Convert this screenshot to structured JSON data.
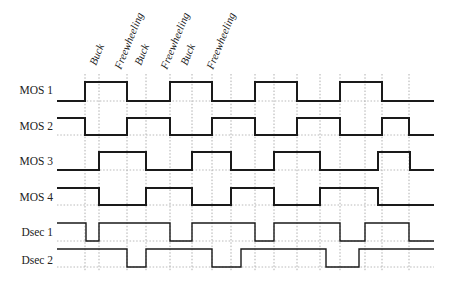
{
  "diagram": {
    "type": "timing-diagram",
    "x_start": 57,
    "x_end": 434,
    "grid_lines_x": [
      85,
      99,
      127,
      146,
      170,
      192,
      212,
      231,
      255,
      274,
      297,
      320,
      340,
      365,
      382,
      409
    ],
    "phase_labels": [
      {
        "text": "Buck",
        "x": 96,
        "y": 66
      },
      {
        "text": "Freewheeling",
        "x": 121,
        "y": 70
      },
      {
        "text": "Buck",
        "x": 141,
        "y": 66
      },
      {
        "text": "Freewheeling",
        "x": 167,
        "y": 70
      },
      {
        "text": "Buck",
        "x": 187,
        "y": 66
      },
      {
        "text": "Freewheeling",
        "x": 213,
        "y": 70
      }
    ],
    "rows": [
      {
        "label": "MOS 1",
        "label_x": 53,
        "label_y": 94,
        "high": 82,
        "low": 101,
        "start_level": "low",
        "transitions": [
          85,
          127,
          170,
          212,
          255,
          297,
          340,
          382
        ],
        "thin": false
      },
      {
        "label": "MOS 2",
        "label_x": 53,
        "label_y": 130,
        "high": 118,
        "low": 135,
        "start_level": "high",
        "transitions": [
          85,
          127,
          170,
          212,
          255,
          297,
          340,
          382,
          409
        ],
        "thin": false
      },
      {
        "label": "MOS 3",
        "label_x": 53,
        "label_y": 165,
        "high": 152,
        "low": 170,
        "start_level": "low",
        "transitions": [
          99,
          146,
          192,
          231,
          274,
          320,
          378,
          410
        ],
        "thin": false
      },
      {
        "label": "MOS 4",
        "label_x": 53,
        "label_y": 201,
        "high": 188,
        "low": 205,
        "start_level": "high",
        "transitions": [
          99,
          146,
          192,
          231,
          274,
          320,
          378
        ],
        "thin": false
      },
      {
        "label": "Dsec 1",
        "label_x": 53,
        "label_y": 236,
        "high": 223,
        "low": 241,
        "start_level": "high",
        "transitions": [
          86,
          99,
          170,
          192,
          255,
          274,
          340,
          365,
          409
        ],
        "thin": true
      },
      {
        "label": "Dsec 2",
        "label_x": 53,
        "label_y": 264,
        "high": 249,
        "low": 267,
        "start_level": "high",
        "transitions": [
          127,
          146,
          212,
          241,
          326,
          359
        ],
        "thin": true
      }
    ]
  }
}
